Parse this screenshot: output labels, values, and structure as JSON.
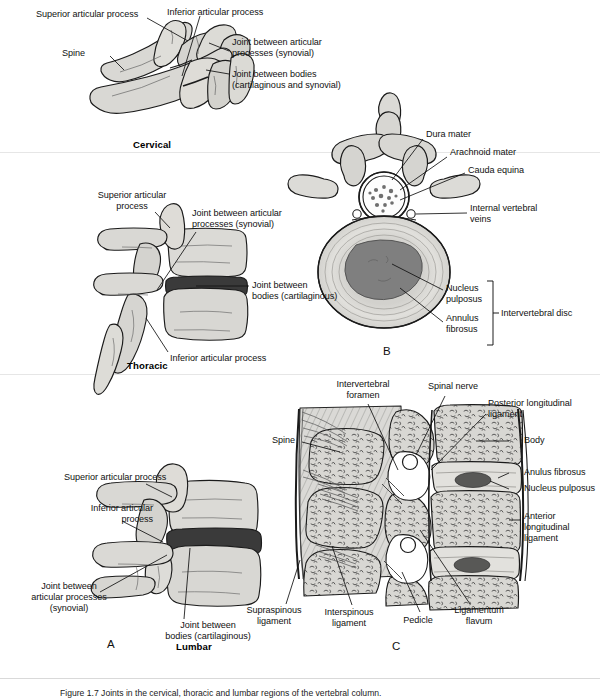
{
  "figure": {
    "caption_prefix": "Figure 1.7",
    "caption_text": "Figure 1.7   Joints in the cervical, thoracic and lumbar regions of the vertebral column.",
    "panels": [
      {
        "letter": "A",
        "x": 107,
        "y": 641
      },
      {
        "letter": "B",
        "x": 383,
        "y": 350
      },
      {
        "letter": "C",
        "x": 392,
        "y": 643
      }
    ]
  },
  "regions": [
    {
      "name": "Cervical",
      "x": 133,
      "y": 140
    },
    {
      "name": "Thoracic",
      "x": 127,
      "y": 362
    },
    {
      "name": "Lumbar",
      "x": 176,
      "y": 643
    }
  ],
  "panel_a_cervical": {
    "labels": [
      {
        "id": "superior-articular-process",
        "text": "Superior articular process",
        "x": 36,
        "y": 9,
        "align": "left"
      },
      {
        "id": "inferior-articular-process",
        "text": "Inferior articular process",
        "x": 167,
        "y": 7,
        "align": "left"
      },
      {
        "id": "spine",
        "text": "Spine",
        "x": 80,
        "y": 51,
        "align": "left"
      },
      {
        "id": "joint-articular-processes",
        "text": "Joint between articular\nprocesses (synovial)",
        "x": 232,
        "y": 37,
        "align": "left"
      },
      {
        "id": "joint-bodies",
        "text": "Joint between bodies\n(cartilaginous and synovial)",
        "x": 232,
        "y": 69,
        "align": "left"
      }
    ]
  },
  "panel_a_thoracic": {
    "labels": [
      {
        "id": "superior-articular-process",
        "text": "Superior articular process",
        "x": 77,
        "y": 192,
        "align": "left"
      },
      {
        "id": "joint-articular-processes",
        "text": "Joint between articular\nprocesses (synovial)",
        "x": 192,
        "y": 210,
        "align": "left"
      },
      {
        "id": "joint-bodies",
        "text": "Joint between\nbodies (cartilaginous)",
        "x": 252,
        "y": 281,
        "align": "left"
      },
      {
        "id": "inferior-articular-process",
        "text": "Inferior articular process",
        "x": 170,
        "y": 355,
        "align": "left"
      }
    ]
  },
  "panel_a_lumbar": {
    "labels": [
      {
        "id": "superior-articular-process",
        "text": "Superior articular process",
        "x": 64,
        "y": 474,
        "align": "left"
      },
      {
        "id": "inferior-articular-process",
        "text": "Inferior articular\nprocess",
        "x": 43,
        "y": 506,
        "align": "left"
      },
      {
        "id": "joint-articular-processes",
        "text": "Joint between\narticular processes\n(synovial)",
        "x": 13,
        "y": 585,
        "align": "left"
      },
      {
        "id": "joint-bodies",
        "text": "Joint between\nbodies (cartilaginous)",
        "x": 155,
        "y": 623,
        "align": "left"
      }
    ]
  },
  "panel_b": {
    "labels": [
      {
        "id": "dura-mater",
        "text": "Dura mater",
        "x": 426,
        "y": 131,
        "align": "left"
      },
      {
        "id": "arachnoid-mater",
        "text": "Arachnoid mater",
        "x": 450,
        "y": 149,
        "align": "left"
      },
      {
        "id": "cauda-equina",
        "text": "Cauda equina",
        "x": 468,
        "y": 167,
        "align": "left"
      },
      {
        "id": "internal-vertebral-veins",
        "text": "Internal vertebral\nveins",
        "x": 470,
        "y": 205,
        "align": "left"
      },
      {
        "id": "nucleus-pulposus",
        "text": "Nucleus\npulposus",
        "x": 446,
        "y": 286,
        "align": "left"
      },
      {
        "id": "annulus-fibrosus",
        "text": "Annulus\nfibrosus",
        "x": 446,
        "y": 315,
        "align": "left"
      },
      {
        "id": "intervertebral-disc",
        "text": "Intervertebral disc",
        "x": 500,
        "y": 313,
        "align": "left"
      }
    ]
  },
  "panel_c": {
    "labels": [
      {
        "id": "intervertebral-foramen",
        "text": "Intervertebral\nforamen",
        "x": 330,
        "y": 381,
        "align": "center"
      },
      {
        "id": "spinal-nerve",
        "text": "Spinal nerve",
        "x": 430,
        "y": 383,
        "align": "left"
      },
      {
        "id": "posterior-longitudinal-ligament",
        "text": "Posterior longitudinal\nligament",
        "x": 488,
        "y": 400,
        "align": "left"
      },
      {
        "id": "spine",
        "text": "Spine",
        "x": 272,
        "y": 437,
        "align": "left"
      },
      {
        "id": "body",
        "text": "Body",
        "x": 512,
        "y": 440,
        "align": "left"
      },
      {
        "id": "anulus-fibrosus",
        "text": "Anulus fibrosus",
        "x": 512,
        "y": 472,
        "align": "left"
      },
      {
        "id": "nucleus-pulposus",
        "text": "Nucleus pulposus",
        "x": 512,
        "y": 488,
        "align": "left"
      },
      {
        "id": "anterior-longitudinal-ligament",
        "text": "Anterior\nlongitudinal\nligament",
        "x": 512,
        "y": 513,
        "align": "left"
      },
      {
        "id": "supraspinous-ligament",
        "text": "Supraspinous\nligament",
        "x": 271,
        "y": 611,
        "align": "center"
      },
      {
        "id": "interspinous-ligament",
        "text": "Interspinous\nligament",
        "x": 348,
        "y": 613,
        "align": "center"
      },
      {
        "id": "pedicle",
        "text": "Pedicle",
        "x": 418,
        "y": 620,
        "align": "center"
      },
      {
        "id": "ligamentum-flavum",
        "text": "Ligamentum\nflavum",
        "x": 469,
        "y": 611,
        "align": "center"
      }
    ]
  },
  "colors": {
    "bone_fill": "#d6d5d2",
    "bone_fill_light": "#e4e3e0",
    "bone_stroke": "#1b1b1b",
    "disc_dark": "#3a3a3a",
    "nucleus_gray": "#7f7f7f",
    "annulus_light": "#dcdcdc",
    "leader_line": "#111111",
    "divider": "#e2e2e2",
    "background": "#ffffff"
  }
}
